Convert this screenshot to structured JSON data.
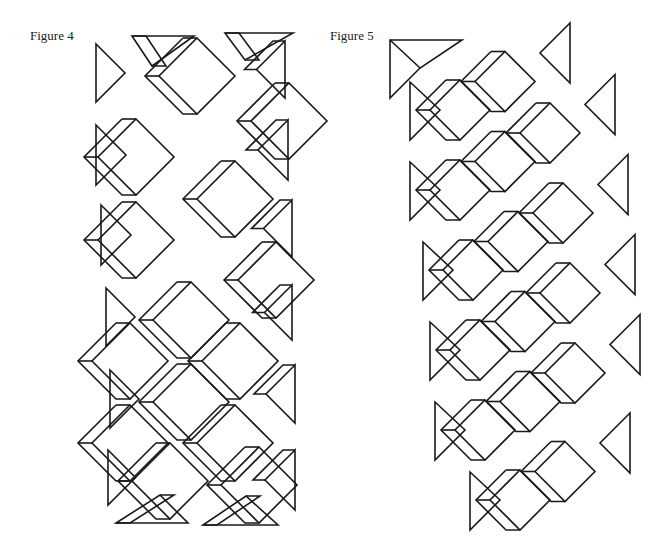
{
  "figures": [
    {
      "label": "Figure 4",
      "label_x": 30,
      "label_y": 37
    },
    {
      "label": "Figure 5",
      "label_x": 330,
      "label_y": 37
    }
  ],
  "style": {
    "stroke": "#1a1a1a",
    "background": "#ffffff"
  },
  "fig4": {
    "cube_half": 38,
    "bevel": 14,
    "cubes": [
      [
        197,
        76
      ],
      [
        289,
        121
      ],
      [
        136,
        157
      ],
      [
        235,
        199
      ],
      [
        136,
        240
      ],
      [
        276,
        280
      ],
      [
        191,
        320
      ],
      [
        130,
        361
      ],
      [
        240,
        361
      ],
      [
        191,
        402
      ],
      [
        130,
        443
      ],
      [
        235,
        443
      ],
      [
        170,
        481
      ],
      [
        259,
        485
      ]
    ],
    "left_triangles": [
      [
        96,
        44,
        102
      ],
      [
        96,
        125,
        185
      ],
      [
        101,
        205,
        265
      ],
      [
        106,
        288,
        346
      ],
      [
        110,
        370,
        428
      ],
      [
        108,
        450,
        505
      ]
    ],
    "right_triangles": [
      [
        285,
        41,
        98
      ],
      [
        288,
        120,
        180
      ],
      [
        292,
        200,
        257
      ],
      [
        292,
        285,
        340
      ],
      [
        295,
        365,
        423
      ],
      [
        295,
        450,
        510
      ]
    ],
    "top_triangles": [
      [
        132,
        36,
        194,
        36,
        152,
        66
      ],
      [
        225,
        33,
        293,
        33,
        245,
        60
      ]
    ],
    "bottom_triangles": [
      [
        116,
        523,
        188,
        523,
        160,
        495
      ],
      [
        203,
        525,
        278,
        525,
        246,
        496
      ]
    ]
  },
  "fig5": {
    "cube_half": 30,
    "rows": [
      {
        "start": [
          430,
          110
        ],
        "count": 2
      },
      {
        "start": [
          430,
          190
        ],
        "count": 3
      },
      {
        "start": [
          443,
          270
        ],
        "count": 3
      },
      {
        "start": [
          450,
          350
        ],
        "count": 3
      },
      {
        "start": [
          455,
          430
        ],
        "count": 3
      },
      {
        "start": [
          490,
          500
        ],
        "count": 2
      }
    ]
  }
}
